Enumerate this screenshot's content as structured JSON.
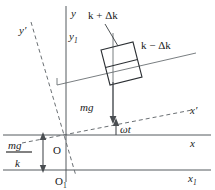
{
  "figure": {
    "labels": {
      "y_axis": "y",
      "y1_axis": "y",
      "y1_sub": "1",
      "y_prime_axis": "y",
      "y_prime_mark": "′",
      "x_axis": "x",
      "x1_axis": "x",
      "x1_sub": "1",
      "x_prime_axis": "x",
      "x_prime_mark": "′",
      "origin": "O",
      "origin1": "O",
      "origin1_sub": "1",
      "spring_stiff_plus": "k + Δk",
      "spring_stiff_minus": "k − Δk",
      "weight_force": "mg",
      "angle": "ωt",
      "static_deflection_numerator": "mg",
      "static_deflection_denominator": "k"
    },
    "colors": {
      "line": "#555a5e",
      "dashed": "#6a6f73",
      "box": "#2b2f33",
      "text": "#1a1a1a",
      "background": "#ffffff"
    }
  }
}
